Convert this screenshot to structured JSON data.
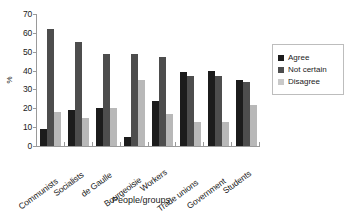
{
  "chart_data": {
    "type": "bar",
    "title": "",
    "xlabel": "People/groups",
    "ylabel": "%",
    "ylim": [
      0,
      70
    ],
    "yticks": [
      0,
      10,
      20,
      30,
      40,
      50,
      60,
      70
    ],
    "grid": false,
    "legend_position": "right",
    "categories": [
      "Communists",
      "Socialists",
      "de Gaulle",
      "Bourgeoisie",
      "Workers",
      "Trade unions",
      "Government",
      "Students"
    ],
    "series": [
      {
        "name": "Agree",
        "color": "#1c1c1c",
        "values": [
          9,
          19,
          20,
          5,
          24,
          39,
          40,
          35
        ]
      },
      {
        "name": "Not certain",
        "color": "#4d4d4d",
        "values": [
          62,
          55,
          49,
          49,
          47,
          37,
          37,
          34
        ]
      },
      {
        "name": "Disagree",
        "color": "#b8b8b8",
        "values": [
          18,
          15,
          20,
          35,
          17,
          13,
          13,
          22
        ]
      }
    ]
  },
  "legend": {
    "items": [
      {
        "label": "Agree",
        "swatch": "agree"
      },
      {
        "label": "Not certain",
        "swatch": "notcertain"
      },
      {
        "label": "Disagree",
        "swatch": "disagree"
      }
    ]
  }
}
